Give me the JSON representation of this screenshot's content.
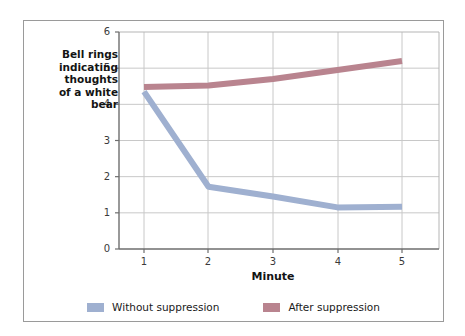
{
  "figure": {
    "background_color": "#ffffff",
    "border_color": "#9a9a9a"
  },
  "chart_data": {
    "type": "line",
    "title": "",
    "xlabel": "Minute",
    "ylabel": "Bell rings\nindicating\nthoughts\nof a white\nbear",
    "x": [
      1,
      2,
      3,
      4,
      5
    ],
    "xticklabels": [
      "1",
      "2",
      "3",
      "4",
      "5"
    ],
    "yticklabels": [
      "0",
      "1",
      "2",
      "3",
      "4",
      "5",
      "6"
    ],
    "xlim": [
      0.6,
      5.4
    ],
    "ylim": [
      0,
      6
    ],
    "grid": "horizontal-and-vertical",
    "legend_position": "bottom-center",
    "series": [
      {
        "name": "Without suppression",
        "color": "#9fb0d0",
        "values": [
          4.35,
          1.72,
          1.45,
          1.15,
          1.17
        ]
      },
      {
        "name": "After suppression",
        "color": "#b9848f",
        "values": [
          4.48,
          4.52,
          4.7,
          4.95,
          5.2
        ]
      }
    ]
  },
  "legend": {
    "entries": [
      {
        "label": "Without suppression",
        "color": "#9fb0d0"
      },
      {
        "label": "After suppression",
        "color": "#b9848f"
      }
    ]
  },
  "axes": {
    "axis_line_color": "#6e6e6e",
    "grid_color": "#c8c8c8",
    "tick_text_color": "#3a3a3a"
  }
}
